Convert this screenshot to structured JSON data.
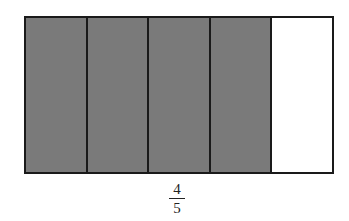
{
  "diagram": {
    "type": "fraction-bar",
    "total_parts": 5,
    "shaded_parts": 4,
    "parts": [
      {
        "state": "shaded"
      },
      {
        "state": "shaded"
      },
      {
        "state": "shaded"
      },
      {
        "state": "shaded"
      },
      {
        "state": "empty"
      }
    ],
    "colors": {
      "shaded": "#7a7a7a",
      "empty": "#ffffff",
      "border": "#1a1a1a"
    },
    "label": {
      "numerator": "4",
      "denominator": "5"
    }
  }
}
